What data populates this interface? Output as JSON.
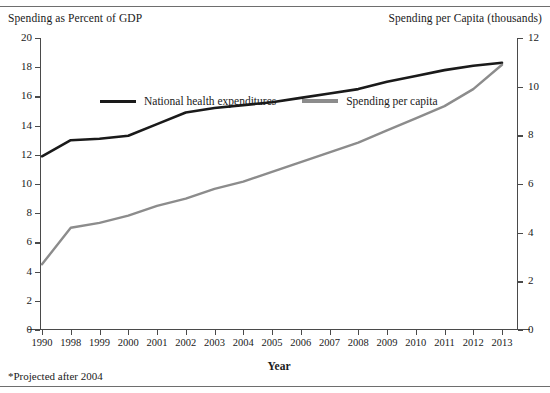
{
  "titles": {
    "left_axis": "Spending as Percent of GDP",
    "right_axis": "Spending per Capita (thousands)",
    "x_axis": "Year"
  },
  "footnote": "*Projected after 2004",
  "colors": {
    "series_black": "#1a1a1a",
    "series_gray": "#8c8c8c",
    "axis": "#4a4a4a",
    "rule": "#6e6e6e",
    "background": "#ffffff"
  },
  "legend": {
    "position": "top-left-inside",
    "items": [
      {
        "label": "National health expenditures",
        "color": "#1a1a1a"
      },
      {
        "label": "Spending per capita",
        "color": "#8c8c8c"
      }
    ]
  },
  "axes": {
    "left": {
      "label": "Spending as Percent of GDP",
      "ticks": [
        "0",
        "2",
        "4",
        "6",
        "8",
        "10",
        "12",
        "14",
        "16",
        "18",
        "20"
      ],
      "min": 0,
      "max": 20,
      "step": 2
    },
    "right": {
      "label": "Spending per Capita (thousands)",
      "ticks": [
        "0",
        "2",
        "4",
        "6",
        "8",
        "10",
        "12"
      ],
      "min": 0,
      "max": 12,
      "step": 2
    },
    "x": {
      "label": "Year",
      "ticks": [
        "1990",
        "1998",
        "1999",
        "2000",
        "2001",
        "2002",
        "2003",
        "2004",
        "2005",
        "2006",
        "2007",
        "2008",
        "2009",
        "2010",
        "2011",
        "2012",
        "2013"
      ]
    }
  },
  "chart_data": {
    "type": "line",
    "title": "",
    "xlabel": "Year",
    "ylabel": "Spending as Percent of GDP",
    "y2label": "Spending per Capita (thousands)",
    "grid": false,
    "legend_position": "top-left-inside",
    "categories": [
      "1990",
      "1998",
      "1999",
      "2000",
      "2001",
      "2002",
      "2003",
      "2004",
      "2005",
      "2006",
      "2007",
      "2008",
      "2009",
      "2010",
      "2011",
      "2012",
      "2013"
    ],
    "ylim": [
      0,
      20
    ],
    "y2lim": [
      0,
      12
    ],
    "series": [
      {
        "name": "National health expenditures",
        "color": "#1a1a1a",
        "axis": "left",
        "units": "percent of GDP",
        "values": [
          11.9,
          13.0,
          13.1,
          13.3,
          14.1,
          14.9,
          15.2,
          15.4,
          15.6,
          15.9,
          16.2,
          16.5,
          17.0,
          17.4,
          17.8,
          18.1,
          18.3
        ]
      },
      {
        "name": "Spending per capita",
        "color": "#8c8c8c",
        "axis": "right",
        "units": "thousands of dollars",
        "values": [
          2.7,
          4.2,
          4.4,
          4.7,
          5.1,
          5.4,
          5.8,
          6.1,
          6.5,
          6.9,
          7.3,
          7.7,
          8.2,
          8.7,
          9.2,
          9.9,
          10.9
        ]
      }
    ],
    "annotations": [
      "*Projected after 2004"
    ]
  }
}
